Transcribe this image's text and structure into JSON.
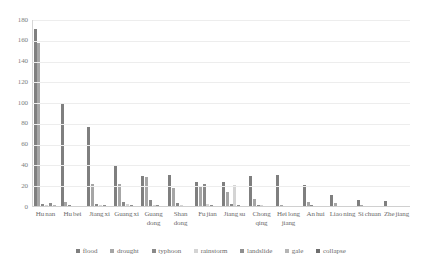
{
  "chart_data": {
    "type": "bar",
    "title": "",
    "xlabel": "",
    "ylabel": "",
    "ylim": [
      0,
      180
    ],
    "yticks": [
      180,
      160,
      140,
      120,
      100,
      80,
      60,
      40,
      20,
      0
    ],
    "grid": true,
    "legend_position": "bottom",
    "categories": [
      "Hu nan",
      "Hu bei",
      "Jiang xi",
      "Guang xi",
      "Guang dong",
      "Shan dong",
      "Fu jian",
      "Jiang su",
      "Chong qing",
      "Hei long jiang",
      "An hui",
      "Liao ning",
      "Si chuan",
      "Zhe jiang"
    ],
    "series": [
      {
        "name": "flood",
        "color": "#7f7f7f",
        "values": [
          171,
          100,
          77,
          40,
          30,
          31,
          24,
          24,
          30,
          31,
          21,
          12,
          7,
          6
        ]
      },
      {
        "name": "drought",
        "color": "#a6a6a6",
        "values": [
          158,
          5,
          22,
          22,
          29,
          18,
          19,
          14,
          8,
          2,
          5,
          4,
          2,
          1
        ]
      },
      {
        "name": "typhoon",
        "color": "#898989",
        "values": [
          3,
          2,
          3,
          5,
          7,
          4,
          22,
          3,
          2,
          1,
          2,
          1,
          0,
          1
        ]
      },
      {
        "name": "rainstorm",
        "color": "#d4d4d4",
        "values": [
          2,
          1,
          2,
          3,
          2,
          2,
          3,
          21,
          2,
          1,
          1,
          1,
          0,
          0
        ]
      },
      {
        "name": "landslide",
        "color": "#8f8f8f",
        "values": [
          4,
          1,
          2,
          2,
          2,
          1,
          2,
          2,
          1,
          1,
          1,
          0,
          0,
          0
        ]
      },
      {
        "name": "gale",
        "color": "#b5b5b5",
        "values": [
          2,
          1,
          1,
          1,
          1,
          1,
          1,
          1,
          1,
          1,
          1,
          0,
          0,
          0
        ]
      },
      {
        "name": "collapse",
        "color": "#6e6e6e",
        "values": [
          1,
          1,
          1,
          1,
          1,
          1,
          1,
          1,
          0,
          0,
          0,
          0,
          0,
          0
        ]
      }
    ]
  }
}
